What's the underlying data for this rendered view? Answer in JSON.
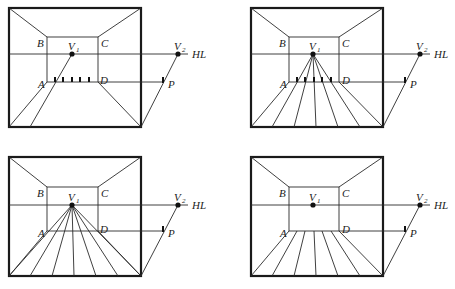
{
  "figure": {
    "labels": {
      "B": "B",
      "C": "C",
      "A": "A",
      "D": "D",
      "P": "P",
      "V": "V",
      "v1_sub": "1",
      "v2_sub": "2",
      "HL": "HL"
    },
    "panels": [
      {
        "id": "top-left",
        "description": "floor tick marks on AD; line from V1 through first tick to floor; line from P to V2",
        "ticks_on_AD": 5
      },
      {
        "id": "top-right",
        "description": "lines radiating from V1 through the ticks on AD to the floor edge",
        "ticks_on_AD": 5
      },
      {
        "id": "bottom-left",
        "description": "floor lines converging to V1",
        "ticks_on_AD": 0
      },
      {
        "id": "bottom-right",
        "description": "floor lines from AD edge to bottom of frame",
        "ticks_on_AD": 0
      }
    ],
    "caption": ""
  }
}
